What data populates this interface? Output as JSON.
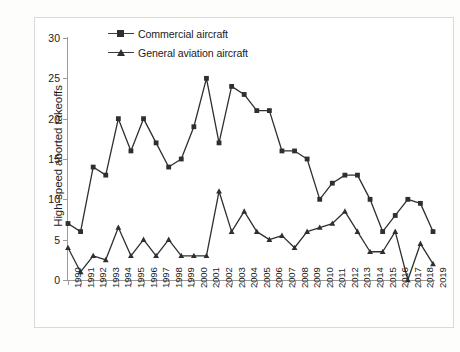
{
  "chart_data": {
    "type": "line",
    "title": "",
    "xlabel": "",
    "ylabel": "High-speed aborted takeoffs",
    "ylim": [
      0,
      30
    ],
    "yticks": [
      0,
      5,
      10,
      15,
      20,
      25,
      30
    ],
    "grid": false,
    "legend_position": "top-center",
    "categories": [
      "1990",
      "1991",
      "1992",
      "1993",
      "1994",
      "1995",
      "1996",
      "1997",
      "1998",
      "1999",
      "2000",
      "2001",
      "2002",
      "2003",
      "2004",
      "2005",
      "2006",
      "2007",
      "2008",
      "2009",
      "2010",
      "2011",
      "2012",
      "2013",
      "2014",
      "2015",
      "2016",
      "2017",
      "2018",
      "2019"
    ],
    "series": [
      {
        "name": "Commercial aircraft",
        "marker": "square",
        "color": "#2f2f2f",
        "values": [
          7,
          6,
          14,
          13,
          20,
          16,
          20,
          17,
          14,
          15,
          19,
          25,
          17,
          24,
          23,
          21,
          21,
          16,
          16,
          15,
          10,
          12,
          13,
          13,
          10,
          6,
          8,
          10,
          9.5,
          6
        ]
      },
      {
        "name": "General aviation aircraft",
        "marker": "triangle",
        "color": "#2f2f2f",
        "values": [
          4,
          1,
          3,
          2.5,
          6.5,
          3,
          5,
          3,
          5,
          3,
          3,
          3,
          11,
          6,
          8.5,
          6,
          5,
          5.5,
          4,
          6,
          6.5,
          7,
          8.5,
          6,
          3.5,
          3.5,
          6,
          0,
          4.5,
          2
        ]
      }
    ]
  },
  "axis": {
    "y_title": "High-speed aborted takeoffs",
    "y_tick_labels": [
      "0",
      "5",
      "10",
      "15",
      "20",
      "25",
      "30"
    ]
  },
  "legend": {
    "items": [
      {
        "label": "Commercial aircraft",
        "marker": "square-marker-icon"
      },
      {
        "label": "General aviation aircraft",
        "marker": "triangle-marker-icon"
      }
    ]
  }
}
